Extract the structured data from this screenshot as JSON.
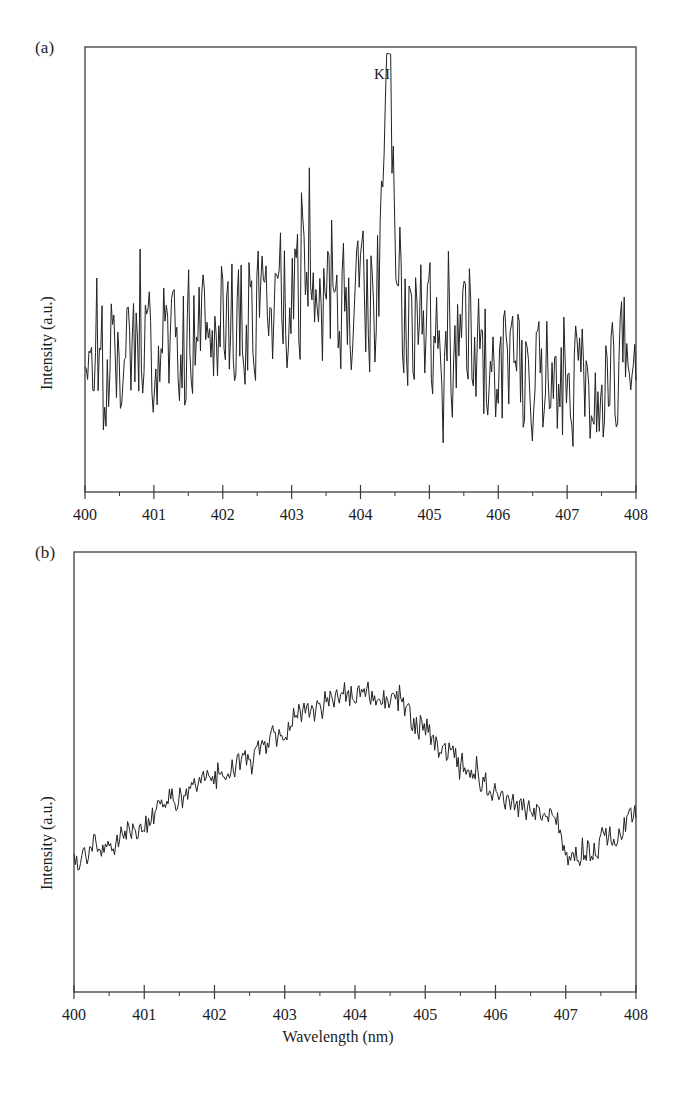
{
  "figure": {
    "background_color": "#ffffff",
    "line_color": "#222222",
    "frame_color": "#4a4a4a",
    "xlabel": "Wavelength (nm)",
    "panels": [
      {
        "tag": "(a)",
        "ylabel": "Intensity (a.u.)",
        "annotation": "KI",
        "annotation_x": 404.4
      },
      {
        "tag": "(b)",
        "ylabel": "Intensity (a.u.)",
        "annotation": "",
        "annotation_x": null
      }
    ]
  },
  "chart_data": [
    {
      "type": "line",
      "panel": "(a)",
      "title": "",
      "xlabel": "",
      "ylabel": "Intensity (a.u.)",
      "xlim": [
        400,
        408
      ],
      "ylim": [
        0,
        1
      ],
      "xticks": [
        400,
        401,
        402,
        403,
        404,
        405,
        406,
        407,
        408
      ],
      "xticklabels": [
        "400",
        "401",
        "402",
        "403",
        "404",
        "405",
        "406",
        "407",
        "408"
      ],
      "minor_xticks": [
        400.5,
        401.5,
        402.5,
        403.5,
        404.5,
        405.5,
        406.5,
        407.5
      ],
      "yticks": [],
      "yticklabels": [],
      "grid": false,
      "legend": false,
      "annotations": [
        {
          "text": "KI",
          "x": 404.4,
          "y": 0.93,
          "description": "potassium atomic emission line"
        }
      ],
      "description": "Noisy emission spectrum with dense high-frequency spikes on a broad hump centred near 403 nm; a single tall sharp KI line at 404.4 nm reaches the highest intensity of the panel.",
      "series": [
        {
          "name": "spectrum-a",
          "noise_seed": 20394,
          "noise_amplitude": 0.155,
          "baseline_nodes_x": [
            400.0,
            400.5,
            401.0,
            401.6,
            402.2,
            402.8,
            403.4,
            404.0,
            404.6,
            405.2,
            405.8,
            406.4,
            407.0,
            407.5,
            408.0
          ],
          "baseline_nodes_y": [
            0.275,
            0.3,
            0.345,
            0.375,
            0.4,
            0.425,
            0.435,
            0.41,
            0.385,
            0.345,
            0.3,
            0.26,
            0.25,
            0.265,
            0.275
          ],
          "peaks": [
            {
              "center": 404.4,
              "height": 0.6,
              "width": 0.035,
              "shoulder_height": 0.3,
              "shoulder_width": 0.085
            }
          ],
          "sample_count": 420
        }
      ]
    },
    {
      "type": "line",
      "panel": "(b)",
      "title": "",
      "xlabel": "Wavelength (nm)",
      "ylabel": "Intensity (a.u.)",
      "xlim": [
        400,
        408
      ],
      "ylim": [
        0,
        1
      ],
      "xticks": [
        400,
        401,
        402,
        403,
        404,
        405,
        406,
        407,
        408
      ],
      "xticklabels": [
        "400",
        "401",
        "402",
        "403",
        "404",
        "405",
        "406",
        "407",
        "408"
      ],
      "minor_xticks": [
        400.5,
        401.5,
        402.5,
        403.5,
        404.5,
        405.5,
        406.5,
        407.5
      ],
      "yticks": [],
      "yticklabels": [],
      "grid": false,
      "legend": false,
      "annotations": [],
      "description": "Smooth broad continuum band with low-amplitude ripple; intensity rises from 400 nm to a broad maximum near 404 nm, falls steadily to a minimum near 407 nm, then rises again toward 408 nm.",
      "series": [
        {
          "name": "spectrum-b",
          "noise_seed": 778211,
          "noise_amplitude": 0.03,
          "baseline_nodes_x": [
            400.0,
            400.4,
            400.9,
            401.4,
            401.9,
            402.4,
            402.9,
            403.4,
            403.8,
            404.1,
            404.5,
            404.9,
            405.3,
            405.7,
            406.1,
            406.5,
            406.85,
            407.05,
            407.3,
            407.6,
            408.0
          ],
          "baseline_nodes_y": [
            0.295,
            0.315,
            0.375,
            0.435,
            0.475,
            0.525,
            0.58,
            0.635,
            0.672,
            0.678,
            0.66,
            0.61,
            0.545,
            0.49,
            0.44,
            0.41,
            0.395,
            0.3,
            0.31,
            0.355,
            0.4
          ],
          "peaks": [],
          "sample_count": 430
        }
      ]
    }
  ],
  "geometry": {
    "panel_a": {
      "left": 85,
      "right": 636,
      "top": 47,
      "bottom": 492
    },
    "panel_b": {
      "left": 74,
      "right": 636,
      "top": 552,
      "bottom": 992
    },
    "tick_major_length": 7,
    "tick_minor_length": 4
  }
}
